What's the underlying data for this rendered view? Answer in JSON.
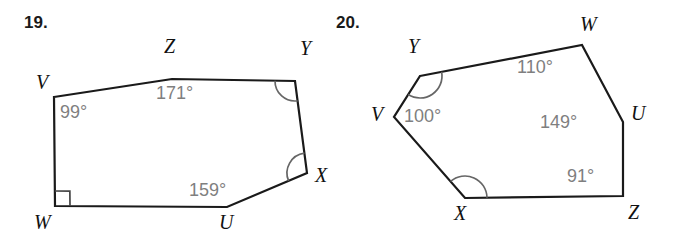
{
  "page": {
    "background_color": "#ffffff",
    "width": 674,
    "height": 248,
    "line_color": "#1a1a1a",
    "angle_label_color": "#7f7f7f",
    "vertex_label_color": "#111111"
  },
  "problems": [
    {
      "number_label": "19.",
      "shape": "pentagon",
      "vertices": [
        {
          "name": "V",
          "x": 54,
          "y": 97,
          "label_x": 36,
          "label_y": 72
        },
        {
          "name": "Z",
          "x": 172,
          "y": 79,
          "label_x": 164,
          "label_y": 36
        },
        {
          "name": "Y",
          "x": 295,
          "y": 81,
          "label_x": 300,
          "label_y": 38
        },
        {
          "name": "X",
          "x": 307,
          "y": 173,
          "label_x": 315,
          "label_y": 165
        },
        {
          "name": "U",
          "x": 227,
          "y": 207,
          "label_x": 219,
          "label_y": 212
        },
        {
          "name": "W",
          "x": 55,
          "y": 206,
          "label_x": 34,
          "label_y": 212
        }
      ],
      "angles": [
        {
          "vertex": "V",
          "value": "99°",
          "label_x": 60,
          "label_y": 103,
          "mark": "none"
        },
        {
          "vertex": "Z",
          "value": "171°",
          "label_x": 156,
          "label_y": 84,
          "mark": "none"
        },
        {
          "vertex": "Y",
          "value": "",
          "label_x": 0,
          "label_y": 0,
          "mark": "arc"
        },
        {
          "vertex": "X",
          "value": "",
          "label_x": 0,
          "label_y": 0,
          "mark": "arc"
        },
        {
          "vertex": "U",
          "value": "159°",
          "label_x": 189,
          "label_y": 181,
          "mark": "none"
        },
        {
          "vertex": "W",
          "value": "",
          "label_x": 0,
          "label_y": 0,
          "mark": "right-angle"
        }
      ]
    },
    {
      "number_label": "20.",
      "shape": "hexagon",
      "vertices": [
        {
          "name": "Y",
          "x": 420,
          "y": 76,
          "label_x": 408,
          "label_y": 36
        },
        {
          "name": "W",
          "x": 582,
          "y": 45,
          "label_x": 580,
          "label_y": 14
        },
        {
          "name": "U",
          "x": 623,
          "y": 122,
          "label_x": 631,
          "label_y": 103
        },
        {
          "name": "Z",
          "x": 623,
          "y": 196,
          "label_x": 628,
          "label_y": 202
        },
        {
          "name": "X",
          "x": 465,
          "y": 198,
          "label_x": 454,
          "label_y": 203
        },
        {
          "name": "V",
          "x": 394,
          "y": 117,
          "label_x": 371,
          "label_y": 104
        }
      ],
      "angles": [
        {
          "vertex": "Y",
          "value": "",
          "label_x": 0,
          "label_y": 0,
          "mark": "arc"
        },
        {
          "vertex": "W",
          "value": "110°",
          "label_x": 517,
          "label_y": 58,
          "mark": "none"
        },
        {
          "vertex": "U",
          "value": "149°",
          "label_x": 540,
          "label_y": 113,
          "mark": "none"
        },
        {
          "vertex": "Z",
          "value": "91°",
          "label_x": 567,
          "label_y": 167,
          "mark": "none"
        },
        {
          "vertex": "X",
          "value": "",
          "label_x": 0,
          "label_y": 0,
          "mark": "arc"
        },
        {
          "vertex": "V",
          "value": "100°",
          "label_x": 404,
          "label_y": 107,
          "mark": "none"
        }
      ]
    }
  ]
}
